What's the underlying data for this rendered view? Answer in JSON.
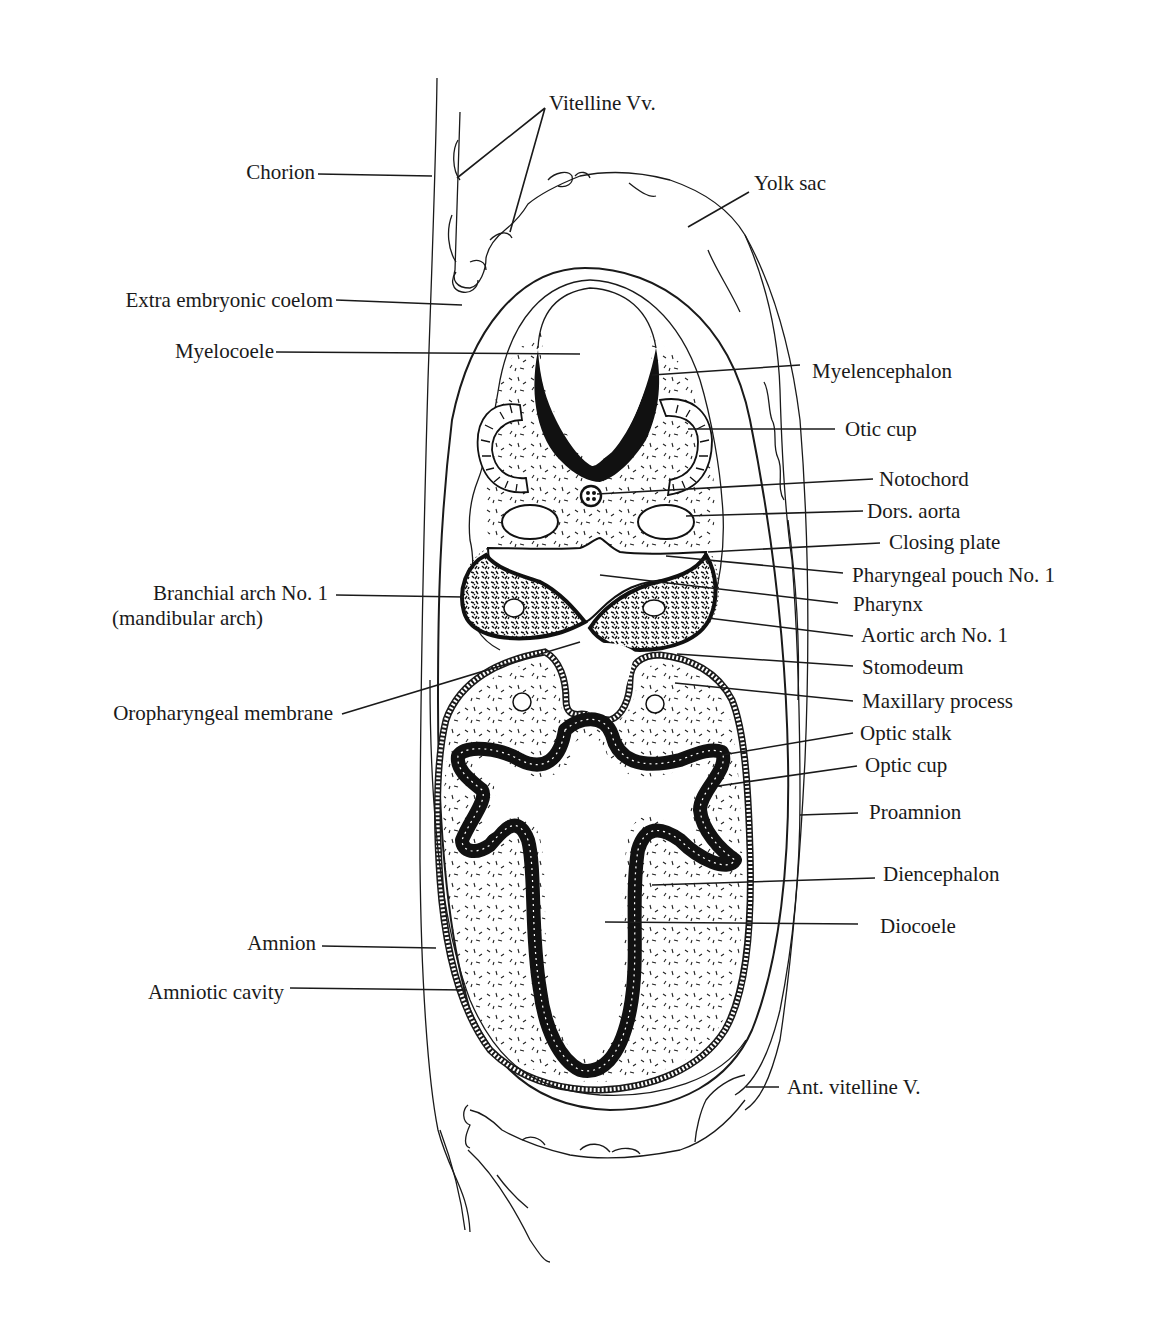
{
  "figure": {
    "type": "anatomical-section-diagram",
    "labels_left": [
      {
        "id": "chorion",
        "text": "Chorion"
      },
      {
        "id": "extra_embryonic_coelom",
        "text": "Extra embryonic coelom"
      },
      {
        "id": "myelocoele",
        "text": "Myelocoele"
      },
      {
        "id": "branchial_arch_1",
        "text": "Branchial arch No. 1"
      },
      {
        "id": "branchial_arch_1_sub",
        "text": "(mandibular arch)"
      },
      {
        "id": "oropharyngeal_membrane",
        "text": "Oropharyngeal membrane"
      },
      {
        "id": "amnion",
        "text": "Amnion"
      },
      {
        "id": "amniotic_cavity",
        "text": "Amniotic cavity"
      }
    ],
    "labels_top": [
      {
        "id": "vitelline_vv",
        "text": "Vitelline Vv."
      },
      {
        "id": "yolk_sac",
        "text": "Yolk sac"
      }
    ],
    "labels_right": [
      {
        "id": "myelencephalon",
        "text": "Myelencephalon"
      },
      {
        "id": "otic_cup",
        "text": "Otic cup"
      },
      {
        "id": "notochord",
        "text": "Notochord"
      },
      {
        "id": "dors_aorta",
        "text": "Dors. aorta"
      },
      {
        "id": "closing_plate",
        "text": "Closing plate"
      },
      {
        "id": "pharyngeal_pouch_1",
        "text": "Pharyngeal pouch No. 1"
      },
      {
        "id": "pharynx",
        "text": "Pharynx"
      },
      {
        "id": "aortic_arch_1",
        "text": "Aortic arch No. 1"
      },
      {
        "id": "stomodeum",
        "text": "Stomodeum"
      },
      {
        "id": "maxillary_process",
        "text": "Maxillary process"
      },
      {
        "id": "optic_stalk",
        "text": "Optic stalk"
      },
      {
        "id": "optic_cup",
        "text": "Optic cup"
      },
      {
        "id": "proamnion",
        "text": "Proamnion"
      },
      {
        "id": "diencephalon",
        "text": "Diencephalon"
      },
      {
        "id": "diocoele",
        "text": "Diocoele"
      },
      {
        "id": "ant_vitelline_v",
        "text": "Ant. vitelline V."
      }
    ]
  }
}
